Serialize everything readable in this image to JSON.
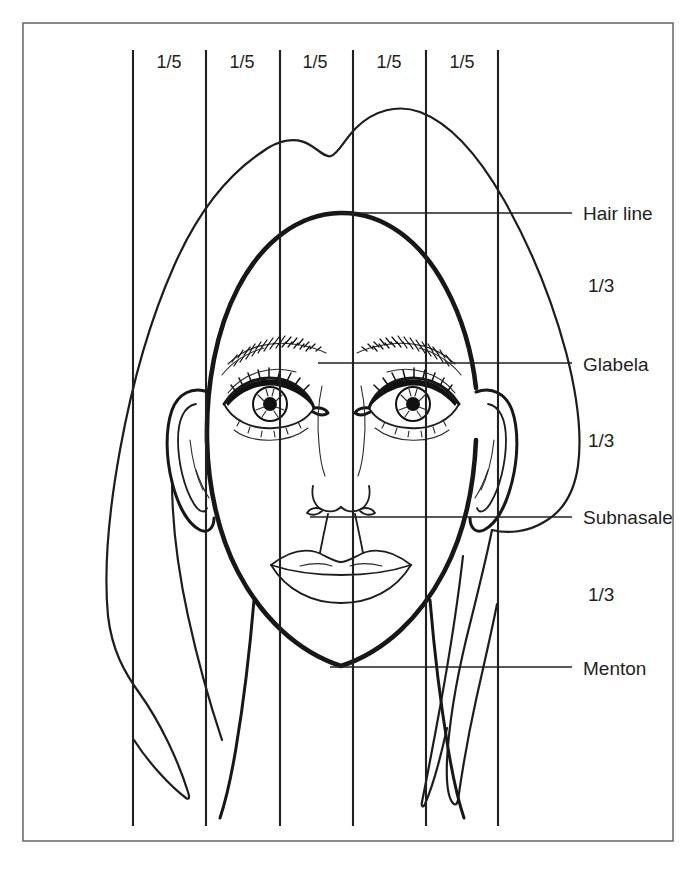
{
  "diagram": {
    "ink_color": "#171717",
    "guide_color": "#231f20",
    "frame_color": "#6e6e6e",
    "background_color": "#ffffff"
  },
  "vertical_fifths": {
    "count": 5,
    "guide_line_count": 6,
    "labels": [
      {
        "text": "1/5",
        "x": 169,
        "y": 68
      },
      {
        "text": "1/5",
        "x": 242,
        "y": 68
      },
      {
        "text": "1/5",
        "x": 315,
        "y": 68
      },
      {
        "text": "1/5",
        "x": 389,
        "y": 68
      },
      {
        "text": "1/5",
        "x": 462,
        "y": 68
      }
    ],
    "guide_x_positions": [
      133,
      206,
      280,
      353,
      426,
      498
    ],
    "guide_y_top": 50,
    "guide_y_bottom": 826
  },
  "horizontal_thirds": {
    "labels": [
      {
        "text": "1/3",
        "x": 588,
        "y": 292
      },
      {
        "text": "1/3",
        "x": 588,
        "y": 447
      },
      {
        "text": "1/3",
        "x": 588,
        "y": 601
      }
    ]
  },
  "landmarks": [
    {
      "name": "hair-line",
      "text": "Hair line",
      "label_x": 583,
      "label_y": 220,
      "leader_y": 213,
      "leader_x1": 340,
      "leader_x2": 572
    },
    {
      "name": "glabela",
      "text": "Glabela",
      "label_x": 583,
      "label_y": 371,
      "leader_y": 363,
      "leader_x1": 318,
      "leader_x2": 572
    },
    {
      "name": "subnasale",
      "text": "Subnasale",
      "label_x": 583,
      "label_y": 524,
      "leader_y": 517,
      "leader_x1": 310,
      "leader_x2": 572
    },
    {
      "name": "menton",
      "text": "Menton",
      "label_x": 583,
      "label_y": 675,
      "leader_y": 667,
      "leader_x1": 330,
      "leader_x2": 572
    }
  ],
  "frame": {
    "x": 23,
    "y": 23,
    "width": 650,
    "height": 818
  }
}
